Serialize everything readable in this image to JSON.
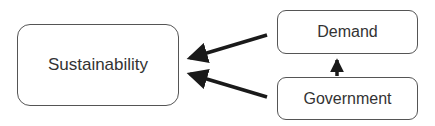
{
  "nodes": {
    "sustainability": {
      "label": "Sustainability"
    },
    "demand": {
      "label": "Demand"
    },
    "government": {
      "label": "Government"
    }
  },
  "edges": [
    {
      "from": "Demand",
      "to": "Sustainability"
    },
    {
      "from": "Government",
      "to": "Sustainability"
    },
    {
      "from": "Government",
      "to": "Demand"
    }
  ],
  "colors": {
    "arrow": "#1a1a1a",
    "border": "#555555",
    "text": "#333333"
  }
}
